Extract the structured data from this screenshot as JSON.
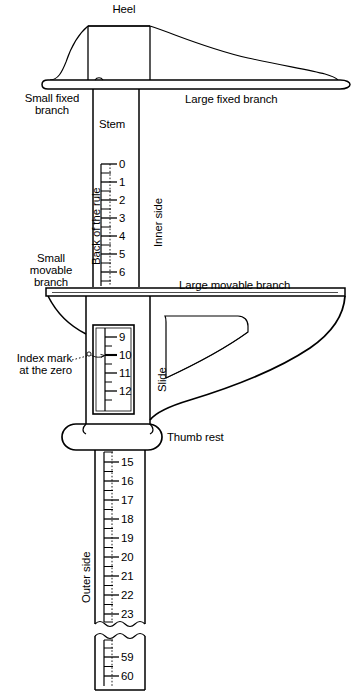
{
  "figure": {
    "ink_color": "#000000",
    "background_color": "#ffffff",
    "width": 355,
    "height": 695
  },
  "labels": {
    "heel": "Heel",
    "small_fixed_branch": "Small fixed\nbranch",
    "large_fixed_branch": "Large fixed branch",
    "stem": "Stem",
    "back_of_the_rule": "Back of the rule",
    "inner_side": "Inner side",
    "small_movable_branch": "Small\nmovable\nbranch",
    "large_movable_branch": "Large movable branch",
    "index_mark": "Index mark\nat the zero",
    "slide": "Slide",
    "thumb_rest": "Thumb rest",
    "outer_side": "Outer side"
  },
  "scales": {
    "upper_stem": {
      "name": "upper-stem-scale",
      "ticks": [
        {
          "value": "0",
          "y": 164
        },
        {
          "value": "1",
          "y": 182
        },
        {
          "value": "2",
          "y": 200
        },
        {
          "value": "3",
          "y": 218
        },
        {
          "value": "4",
          "y": 236
        },
        {
          "value": "5",
          "y": 254
        },
        {
          "value": "6",
          "y": 272
        }
      ]
    },
    "slide_window": {
      "name": "slide-window-scale",
      "ticks": [
        {
          "value": "9",
          "y": 337
        },
        {
          "value": "10",
          "y": 355
        },
        {
          "value": "11",
          "y": 373
        },
        {
          "value": "12",
          "y": 391
        }
      ],
      "index_mark_value": "10"
    },
    "lower_stem": {
      "name": "lower-stem-scale",
      "ticks": [
        {
          "value": "15",
          "y": 462
        },
        {
          "value": "16",
          "y": 481
        },
        {
          "value": "17",
          "y": 500
        },
        {
          "value": "18",
          "y": 519
        },
        {
          "value": "19",
          "y": 538
        },
        {
          "value": "20",
          "y": 557
        },
        {
          "value": "21",
          "y": 576
        },
        {
          "value": "22",
          "y": 595
        },
        {
          "value": "23",
          "y": 614
        }
      ]
    },
    "bottom_fragment": {
      "name": "bottom-fragment-scale",
      "ticks": [
        {
          "value": "59",
          "y": 657
        },
        {
          "value": "60",
          "y": 676
        }
      ]
    }
  }
}
